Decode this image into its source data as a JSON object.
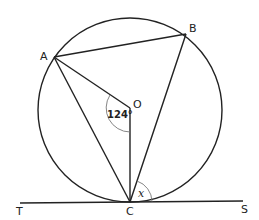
{
  "diagram": {
    "title": "",
    "points": {
      "A": {
        "label": "A",
        "x": 54,
        "y": 57
      },
      "B": {
        "label": "B",
        "x": 186,
        "y": 34
      },
      "O": {
        "label": "O",
        "x": 130,
        "y": 108
      },
      "C": {
        "label": "C",
        "x": 130,
        "y": 202
      },
      "T": {
        "label": "T",
        "x": 20,
        "y": 203
      },
      "S": {
        "label": "S",
        "x": 243,
        "y": 201
      }
    },
    "circle": {
      "cx": 130,
      "cy": 110,
      "r": 92
    },
    "angles": {
      "AOC": {
        "label": "124°",
        "value": 124
      },
      "BCS": {
        "label": "x"
      }
    },
    "colors": {
      "stroke": "#222222",
      "arc": "#777777"
    }
  }
}
